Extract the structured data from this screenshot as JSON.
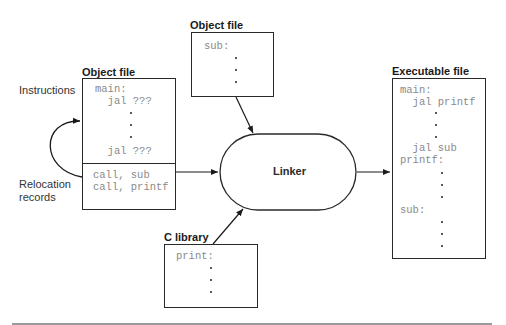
{
  "object_file_top": {
    "title": "Object file",
    "lines": [
      "sub:"
    ]
  },
  "object_file_left": {
    "title": "Object file",
    "instructions": [
      "main:",
      "  jal ???",
      "  jal ???"
    ],
    "relocation_records": [
      "call, sub",
      "call, printf"
    ]
  },
  "side_labels": {
    "instructions": "Instructions",
    "relocation_line1": "Relocation",
    "relocation_line2": "records"
  },
  "linker": {
    "label": "Linker"
  },
  "c_library": {
    "title": "C library",
    "lines": [
      "print:"
    ]
  },
  "executable_file": {
    "title": "Executable file",
    "lines": [
      "main:",
      "  jal printf",
      "  jal sub",
      "printf:",
      "sub:"
    ]
  },
  "colors": {
    "stroke": "#2a2a2a",
    "code_text": "#8a8a8a",
    "rule": "#9a9a9a"
  }
}
